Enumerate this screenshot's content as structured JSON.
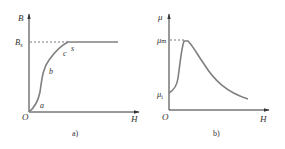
{
  "panels": [
    {
      "caption": "a)",
      "y_axis_label": "B",
      "x_axis_label": "H",
      "origin_label": "O",
      "level_label_main": "B",
      "level_label_sub": "s",
      "curve_points": [
        "a",
        "b",
        "c",
        "s"
      ],
      "description": "Magnetization (B-H) curve saturating at Bs"
    },
    {
      "caption": "b)",
      "y_axis_label": "μ",
      "x_axis_label": "H",
      "origin_label": "O",
      "max_label_main": "μ",
      "max_label_sub": "m",
      "initial_label_main": "μ",
      "initial_label_sub": "i",
      "description": "Permeability μ vs H, rising from μi to peak μm then decaying"
    }
  ],
  "colors": {
    "axis": "#333333",
    "curve": "#808080",
    "dashed": "#555555",
    "text": "#333333"
  }
}
